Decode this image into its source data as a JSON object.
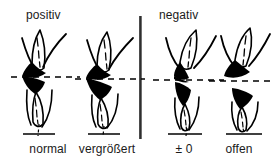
{
  "figure": {
    "background_color": "#ffffff",
    "ink_color": "#000000",
    "groups": [
      {
        "id": "positiv",
        "label": "positiv"
      },
      {
        "id": "negativ",
        "label": "negativ"
      }
    ],
    "divider": {
      "name": "vertical-divider",
      "color": "#1c1c1c"
    },
    "panels": [
      {
        "id": "normal",
        "label": "normal",
        "group": "positiv",
        "reference_line": "dashed",
        "baseline": "solid"
      },
      {
        "id": "vergroessert",
        "label": "vergrößert",
        "group": "positiv",
        "reference_line": "dashed",
        "baseline": "solid"
      },
      {
        "id": "pm-zero",
        "label": "± 0",
        "group": "negativ",
        "reference_line": "dashed",
        "baseline": "solid"
      },
      {
        "id": "offen",
        "label": "offen",
        "group": "negativ",
        "reference_line": "dashed",
        "baseline": "solid"
      }
    ]
  }
}
